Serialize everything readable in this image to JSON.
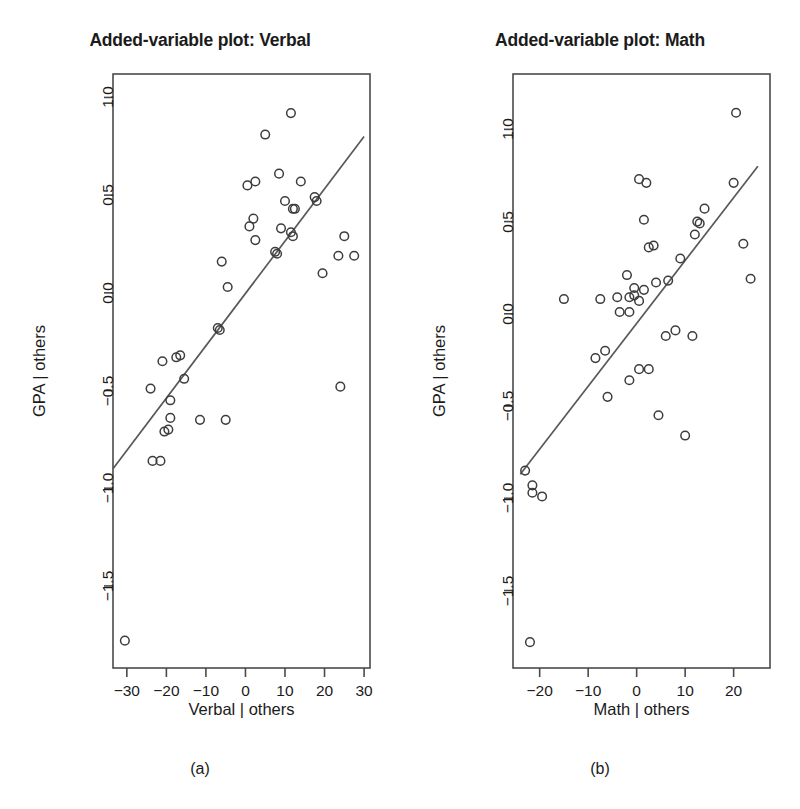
{
  "figure": {
    "background": "#ffffff",
    "point_color": "#3d3d3d",
    "line_color": "#585858",
    "axis_color": "#4a4a4a"
  },
  "panels": [
    {
      "key": "a",
      "title": "Added-variable plot: Verbal",
      "caption": "(a)",
      "xlabel": "Verbal | others",
      "ylabel": "GPA | others"
    },
    {
      "key": "b",
      "title": "Added-variable plot: Math",
      "caption": "(b)",
      "xlabel": "Math | others",
      "ylabel": "GPA | others"
    }
  ],
  "chart_data": [
    {
      "type": "scatter",
      "panel": "a",
      "title": "Added-variable plot: Verbal",
      "caption": "(a)",
      "xlabel": "Verbal | others",
      "ylabel": "GPA | others",
      "xlim": [
        -33.5,
        31.5
      ],
      "ylim": [
        -1.92,
        1.12
      ],
      "xticks": [
        -30,
        -20,
        -10,
        0,
        10,
        20,
        30
      ],
      "xtick_labels": [
        "-30",
        "-20",
        "-10",
        "0",
        "10",
        "20",
        "30"
      ],
      "yticks": [
        1.0,
        0.5,
        0.0,
        -0.5,
        -1.0,
        -1.5
      ],
      "ytick_labels": [
        "1.0",
        "0.5",
        "0.0",
        "-0.5",
        "-1.0",
        "-1.5"
      ],
      "grid": false,
      "legend": "none",
      "fit_line": {
        "x": [
          -33.5,
          30.0
        ],
        "y": [
          -0.9,
          0.8
        ]
      },
      "points": [
        {
          "x": 11.5,
          "y": 0.92
        },
        {
          "x": 5.0,
          "y": 0.81
        },
        {
          "x": 8.5,
          "y": 0.61
        },
        {
          "x": 2.5,
          "y": 0.57
        },
        {
          "x": 14.0,
          "y": 0.57
        },
        {
          "x": 0.5,
          "y": 0.55
        },
        {
          "x": 10.0,
          "y": 0.47
        },
        {
          "x": 17.5,
          "y": 0.49
        },
        {
          "x": 18.0,
          "y": 0.47
        },
        {
          "x": 12.0,
          "y": 0.43
        },
        {
          "x": 12.5,
          "y": 0.43
        },
        {
          "x": 2.0,
          "y": 0.38
        },
        {
          "x": 1.0,
          "y": 0.34
        },
        {
          "x": 9.0,
          "y": 0.33
        },
        {
          "x": 11.5,
          "y": 0.31
        },
        {
          "x": 12.0,
          "y": 0.29
        },
        {
          "x": 25.0,
          "y": 0.29
        },
        {
          "x": 2.5,
          "y": 0.27
        },
        {
          "x": 7.5,
          "y": 0.21
        },
        {
          "x": 8.0,
          "y": 0.2
        },
        {
          "x": 23.5,
          "y": 0.19
        },
        {
          "x": 27.5,
          "y": 0.19
        },
        {
          "x": -6.0,
          "y": 0.16
        },
        {
          "x": 19.5,
          "y": 0.1
        },
        {
          "x": -4.5,
          "y": 0.03
        },
        {
          "x": -7.0,
          "y": -0.18
        },
        {
          "x": -6.5,
          "y": -0.19
        },
        {
          "x": -21.0,
          "y": -0.35
        },
        {
          "x": -17.5,
          "y": -0.33
        },
        {
          "x": -16.5,
          "y": -0.32
        },
        {
          "x": -15.5,
          "y": -0.44
        },
        {
          "x": -19.0,
          "y": -0.55
        },
        {
          "x": -24.0,
          "y": -0.49
        },
        {
          "x": -19.0,
          "y": -0.64
        },
        {
          "x": -11.5,
          "y": -0.65
        },
        {
          "x": -5.0,
          "y": -0.65
        },
        {
          "x": -20.5,
          "y": -0.71
        },
        {
          "x": -19.5,
          "y": -0.7
        },
        {
          "x": -23.5,
          "y": -0.86
        },
        {
          "x": -21.5,
          "y": -0.86
        },
        {
          "x": 24.0,
          "y": -0.48
        },
        {
          "x": -30.5,
          "y": -1.78
        }
      ]
    },
    {
      "type": "scatter",
      "panel": "b",
      "title": "Added-variable plot: Math",
      "caption": "(b)",
      "xlabel": "Math | others",
      "ylabel": "GPA | others",
      "xlim": [
        -25.5,
        27.5
      ],
      "ylim": [
        -1.92,
        1.3
      ],
      "xticks": [
        -20,
        -10,
        0,
        10,
        20
      ],
      "xtick_labels": [
        "-20",
        "-10",
        "0",
        "10",
        "20"
      ],
      "yticks": [
        1.0,
        0.5,
        0.0,
        -0.5,
        -1.0,
        -1.5
      ],
      "ytick_labels": [
        "1.0",
        "0.5",
        "0.0",
        "-0.5",
        "-1.0",
        "-1.5"
      ],
      "grid": false,
      "legend": "none",
      "fit_line": {
        "x": [
          -24.0,
          25.0
        ],
        "y": [
          -0.87,
          0.8
        ]
      },
      "points": [
        {
          "x": 20.5,
          "y": 1.09
        },
        {
          "x": 0.5,
          "y": 0.73
        },
        {
          "x": 2.0,
          "y": 0.71
        },
        {
          "x": 20.0,
          "y": 0.71
        },
        {
          "x": 14.0,
          "y": 0.57
        },
        {
          "x": 1.5,
          "y": 0.51
        },
        {
          "x": 12.5,
          "y": 0.5
        },
        {
          "x": 13.0,
          "y": 0.49
        },
        {
          "x": 12.0,
          "y": 0.43
        },
        {
          "x": 2.5,
          "y": 0.36
        },
        {
          "x": 3.5,
          "y": 0.37
        },
        {
          "x": 22.0,
          "y": 0.38
        },
        {
          "x": 9.0,
          "y": 0.3
        },
        {
          "x": -2.0,
          "y": 0.21
        },
        {
          "x": 6.5,
          "y": 0.18
        },
        {
          "x": 23.5,
          "y": 0.19
        },
        {
          "x": -0.5,
          "y": 0.14
        },
        {
          "x": 1.5,
          "y": 0.13
        },
        {
          "x": 4.0,
          "y": 0.17
        },
        {
          "x": -0.5,
          "y": 0.1
        },
        {
          "x": -7.5,
          "y": 0.08
        },
        {
          "x": -4.0,
          "y": 0.09
        },
        {
          "x": -1.5,
          "y": 0.09
        },
        {
          "x": 0.5,
          "y": 0.07
        },
        {
          "x": -15.0,
          "y": 0.08
        },
        {
          "x": -3.5,
          "y": 0.01
        },
        {
          "x": -1.5,
          "y": 0.01
        },
        {
          "x": 6.0,
          "y": -0.12
        },
        {
          "x": 8.0,
          "y": -0.09
        },
        {
          "x": 11.5,
          "y": -0.12
        },
        {
          "x": -6.5,
          "y": -0.2
        },
        {
          "x": -8.5,
          "y": -0.24
        },
        {
          "x": 0.5,
          "y": -0.3
        },
        {
          "x": 2.5,
          "y": -0.3
        },
        {
          "x": -1.5,
          "y": -0.36
        },
        {
          "x": -6.0,
          "y": -0.45
        },
        {
          "x": 4.5,
          "y": -0.55
        },
        {
          "x": 10.0,
          "y": -0.66
        },
        {
          "x": -23.0,
          "y": -0.85
        },
        {
          "x": -21.5,
          "y": -0.93
        },
        {
          "x": -21.5,
          "y": -0.97
        },
        {
          "x": -19.5,
          "y": -0.99
        },
        {
          "x": -22.0,
          "y": -1.78
        }
      ]
    }
  ]
}
